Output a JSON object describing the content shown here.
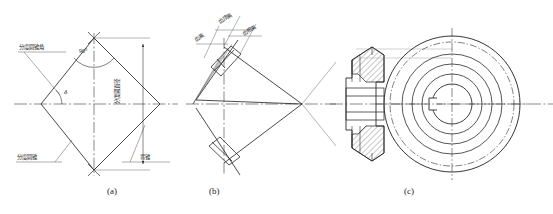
{
  "figure": {
    "type": "engineering-drawing",
    "captions": [
      {
        "id": "a",
        "text": "(a)"
      },
      {
        "id": "b",
        "text": "(b)"
      },
      {
        "id": "c",
        "text": "(c)"
      }
    ]
  },
  "panel_a": {
    "labels": {
      "pitch_cone_angle": "分度圆锥角",
      "pitch_diameter": "分度圆直径",
      "pitch_cone": "分度圆锥",
      "back_cone": "背锥"
    },
    "annotations": {
      "right_angle": "90°",
      "cone_angle_symbol": "δ"
    }
  },
  "panel_b": {
    "labels": {
      "addendum": "齿顶高",
      "dedendum": "齿根高",
      "tooth_height": "齿高"
    }
  },
  "panel_c": {
    "labels": {}
  },
  "colors": {
    "line": "#2b2b2b",
    "thin": "#5a5a5a",
    "center": "#3a3a3a",
    "hatch": "#3a3a3a",
    "background": "#ffffff"
  }
}
